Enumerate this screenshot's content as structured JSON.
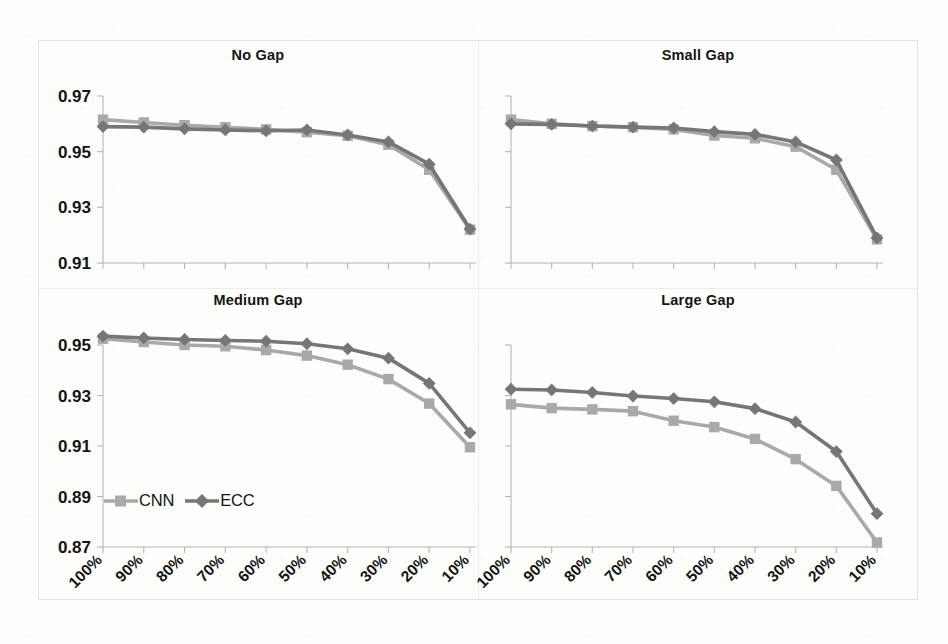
{
  "figure": {
    "background_color": "#fdfdfc",
    "frame_color": "#e2e2e0"
  },
  "legend": {
    "cnn_label": "CNN",
    "ecc_label": "ECC",
    "cnn_color": "#a9a9a9",
    "ecc_color": "#767676",
    "cnn_marker": "square",
    "ecc_marker": "diamond"
  },
  "panels": {
    "no_gap": {
      "title": "No Gap"
    },
    "small_gap": {
      "title": "Small Gap"
    },
    "medium_gap": {
      "title": "Medium Gap"
    },
    "large_gap": {
      "title": "Large Gap"
    }
  },
  "axes": {
    "x_ticks": [
      "100%",
      "90%",
      "80%",
      "70%",
      "60%",
      "50%",
      "40%",
      "30%",
      "20%",
      "10%"
    ],
    "y_ticks_top": [
      "0.97",
      "0.95",
      "0.93",
      "0.91"
    ],
    "y_ticks_bottom": [
      "0.95",
      "0.93",
      "0.91",
      "0.89",
      "0.87"
    ]
  },
  "chart_data": [
    {
      "type": "line",
      "title": "No Gap",
      "xlabel": "",
      "ylabel": "",
      "categories": [
        "100%",
        "90%",
        "80%",
        "70%",
        "60%",
        "50%",
        "40%",
        "30%",
        "20%",
        "10%"
      ],
      "ylim": [
        0.91,
        0.97
      ],
      "yticks": [
        0.91,
        0.93,
        0.95,
        0.97
      ],
      "grid": false,
      "legend_position": "none",
      "series": [
        {
          "name": "CNN",
          "color": "#a9a9a9",
          "marker": "square",
          "values": [
            0.9615,
            0.9605,
            0.9595,
            0.9588,
            0.958,
            0.957,
            0.9557,
            0.9525,
            0.9435,
            0.922
          ]
        },
        {
          "name": "ECC",
          "color": "#767676",
          "marker": "diamond",
          "values": [
            0.959,
            0.9588,
            0.9582,
            0.9578,
            0.9575,
            0.9578,
            0.956,
            0.9535,
            0.9455,
            0.9222
          ]
        }
      ]
    },
    {
      "type": "line",
      "title": "Small Gap",
      "xlabel": "",
      "ylabel": "",
      "categories": [
        "100%",
        "90%",
        "80%",
        "70%",
        "60%",
        "50%",
        "40%",
        "30%",
        "20%",
        "10%"
      ],
      "ylim": [
        0.91,
        0.97
      ],
      "yticks": [
        0.91,
        0.93,
        0.95,
        0.97
      ],
      "grid": false,
      "legend_position": "none",
      "series": [
        {
          "name": "CNN",
          "color": "#a9a9a9",
          "marker": "square",
          "values": [
            0.9615,
            0.96,
            0.9592,
            0.9588,
            0.958,
            0.9558,
            0.9548,
            0.9518,
            0.9435,
            0.9185
          ]
        },
        {
          "name": "ECC",
          "color": "#767676",
          "marker": "diamond",
          "values": [
            0.96,
            0.9598,
            0.9592,
            0.9588,
            0.9585,
            0.9572,
            0.9562,
            0.9535,
            0.947,
            0.919
          ]
        }
      ]
    },
    {
      "type": "line",
      "title": "Medium Gap",
      "xlabel": "",
      "ylabel": "",
      "categories": [
        "100%",
        "90%",
        "80%",
        "70%",
        "60%",
        "50%",
        "40%",
        "30%",
        "20%",
        "10%"
      ],
      "ylim": [
        0.87,
        0.95
      ],
      "yticks": [
        0.87,
        0.89,
        0.91,
        0.93,
        0.95
      ],
      "grid": false,
      "legend_position": "bottom-left",
      "series": [
        {
          "name": "CNN",
          "color": "#a9a9a9",
          "marker": "square",
          "values": [
            0.9525,
            0.9512,
            0.95,
            0.9495,
            0.948,
            0.9458,
            0.9422,
            0.9365,
            0.9268,
            0.9095
          ]
        },
        {
          "name": "ECC",
          "color": "#767676",
          "marker": "diamond",
          "values": [
            0.9535,
            0.9528,
            0.9522,
            0.9518,
            0.9515,
            0.9505,
            0.9485,
            0.9448,
            0.9348,
            0.9152
          ]
        }
      ]
    },
    {
      "type": "line",
      "title": "Large Gap",
      "xlabel": "",
      "ylabel": "",
      "categories": [
        "100%",
        "90%",
        "80%",
        "70%",
        "60%",
        "50%",
        "40%",
        "30%",
        "20%",
        "10%"
      ],
      "ylim": [
        0.87,
        0.95
      ],
      "yticks": [
        0.87,
        0.89,
        0.91,
        0.93,
        0.95
      ],
      "grid": false,
      "legend_position": "none",
      "series": [
        {
          "name": "CNN",
          "color": "#a9a9a9",
          "marker": "square",
          "values": [
            0.9265,
            0.925,
            0.9245,
            0.9238,
            0.92,
            0.9175,
            0.9128,
            0.9048,
            0.8942,
            0.8718
          ]
        },
        {
          "name": "ECC",
          "color": "#767676",
          "marker": "diamond",
          "values": [
            0.9325,
            0.9322,
            0.9312,
            0.9298,
            0.9288,
            0.9275,
            0.9248,
            0.9195,
            0.9078,
            0.8832
          ]
        }
      ]
    }
  ]
}
